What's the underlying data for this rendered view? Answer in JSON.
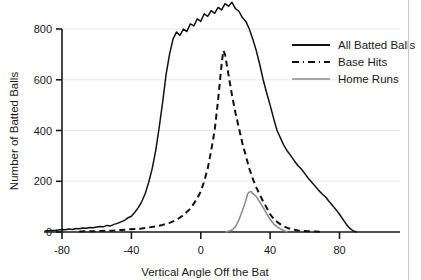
{
  "chart_data": {
    "type": "line",
    "title": "",
    "xlabel": "Vertical Angle Off the Bat",
    "ylabel": "Number of Batted Balls",
    "xlim": [
      -95,
      105
    ],
    "ylim": [
      0,
      915
    ],
    "xticks": [
      -80,
      -40,
      0,
      40,
      80
    ],
    "xtick_labels": [
      "-80",
      "-40",
      "0",
      "40",
      "80"
    ],
    "yticks": [
      0,
      200,
      400,
      600,
      800
    ],
    "ytick_labels": [
      "0",
      "200",
      "400",
      "600",
      "800"
    ],
    "grid": "horizontal-faint",
    "legend_position": "top-right",
    "colors": {
      "all_batted_balls": "#111111",
      "base_hits": "#111111",
      "home_runs": "#8a8a8a",
      "axis": "#1a1a1a",
      "gridline": "#e8e8e8",
      "page_border": "#c8c8c8"
    },
    "series": [
      {
        "name": "All Batted Balls",
        "style": "solid",
        "color": "#111111",
        "x": [
          -90,
          -88,
          -86,
          -84,
          -82,
          -80,
          -78,
          -76,
          -74,
          -72,
          -70,
          -68,
          -66,
          -64,
          -62,
          -60,
          -58,
          -56,
          -54,
          -52,
          -50,
          -48,
          -46,
          -44,
          -42,
          -40,
          -38,
          -36,
          -34,
          -32,
          -30,
          -28,
          -26,
          -24,
          -22,
          -20,
          -18,
          -16,
          -14,
          -12,
          -10,
          -8,
          -6,
          -4,
          -2,
          0,
          2,
          4,
          6,
          8,
          10,
          12,
          14,
          16,
          18,
          20,
          22,
          24,
          26,
          28,
          30,
          32,
          34,
          36,
          38,
          40,
          42,
          44,
          46,
          48,
          50,
          52,
          54,
          56,
          58,
          60,
          62,
          64,
          66,
          68,
          70,
          72,
          74,
          76,
          78,
          80,
          82,
          84,
          86,
          88,
          90
        ],
        "y": [
          4,
          5,
          6,
          6,
          8,
          10,
          9,
          12,
          10,
          14,
          13,
          16,
          15,
          18,
          17,
          20,
          22,
          21,
          26,
          24,
          30,
          34,
          40,
          46,
          56,
          62,
          78,
          96,
          120,
          152,
          196,
          250,
          320,
          410,
          510,
          620,
          700,
          760,
          788,
          775,
          800,
          790,
          820,
          812,
          840,
          830,
          860,
          850,
          872,
          862,
          885,
          875,
          900,
          890,
          905,
          880,
          870,
          845,
          830,
          800,
          760,
          715,
          660,
          600,
          548,
          500,
          448,
          400,
          370,
          340,
          318,
          300,
          280,
          262,
          248,
          230,
          212,
          196,
          180,
          164,
          150,
          138,
          120,
          104,
          88,
          70,
          50,
          30,
          14,
          4,
          0
        ]
      },
      {
        "name": "Base Hits",
        "style": "dashed",
        "color": "#111111",
        "x": [
          -70,
          -66,
          -62,
          -58,
          -54,
          -50,
          -46,
          -42,
          -38,
          -34,
          -30,
          -26,
          -22,
          -18,
          -14,
          -10,
          -6,
          -2,
          0,
          2,
          4,
          6,
          8,
          10,
          12,
          13,
          14,
          16,
          18,
          20,
          22,
          24,
          26,
          28,
          30,
          32,
          34,
          36,
          38,
          40,
          42,
          44,
          46,
          48,
          50,
          52,
          54,
          56,
          58,
          60,
          62,
          66,
          70
        ],
        "y": [
          2,
          3,
          3,
          4,
          5,
          6,
          8,
          10,
          12,
          14,
          18,
          22,
          28,
          36,
          48,
          66,
          92,
          132,
          160,
          200,
          250,
          320,
          400,
          520,
          660,
          715,
          700,
          620,
          540,
          470,
          410,
          350,
          300,
          250,
          210,
          176,
          148,
          120,
          96,
          70,
          52,
          40,
          30,
          22,
          16,
          12,
          9,
          6,
          5,
          4,
          3,
          2,
          0
        ]
      },
      {
        "name": "Home Runs",
        "style": "solid",
        "color": "#8a8a8a",
        "x": [
          14,
          16,
          18,
          20,
          22,
          24,
          26,
          27,
          28,
          29,
          30,
          32,
          34,
          36,
          38,
          40,
          42,
          44,
          46,
          48,
          50
        ],
        "y": [
          0,
          3,
          8,
          20,
          48,
          84,
          124,
          150,
          158,
          160,
          152,
          140,
          118,
          96,
          72,
          50,
          32,
          20,
          12,
          6,
          0
        ]
      }
    ]
  },
  "legend": {
    "items": [
      {
        "label": "All Batted Balls",
        "style": "solid",
        "color": "#111111"
      },
      {
        "label": "Base Hits",
        "style": "dashed",
        "color": "#111111"
      },
      {
        "label": "Home Runs",
        "style": "solid",
        "color": "#8a8a8a"
      }
    ]
  }
}
